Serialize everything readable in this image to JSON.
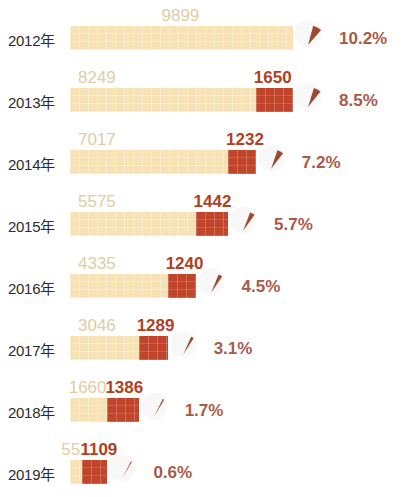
{
  "chart_data": {
    "type": "bar",
    "title": "",
    "subtitle": "",
    "xlabel": "",
    "ylabel": "",
    "orientation": "horizontal",
    "stacked": true,
    "grid": false,
    "legend_position": "none",
    "categories": [
      "2012年",
      "2013年",
      "2014年",
      "2015年",
      "2016年",
      "2017年",
      "2018年",
      "2019年"
    ],
    "series": [
      {
        "name": "cream",
        "color": "#f7e2b6",
        "values": [
          9899,
          8249,
          7017,
          5575,
          4335,
          3046,
          1660,
          551
        ]
      },
      {
        "name": "red",
        "color": "#c0452b",
        "values": [
          null,
          1650,
          1232,
          1442,
          1240,
          1289,
          1386,
          1109
        ]
      }
    ],
    "annotations": {
      "name": "percent",
      "color": "#a85a4a",
      "values": [
        "10.2%",
        "8.5%",
        "7.2%",
        "5.7%",
        "4.5%",
        "3.1%",
        "1.7%",
        "0.6%"
      ],
      "numeric": [
        10.2,
        8.5,
        7.2,
        5.7,
        4.5,
        3.1,
        1.7,
        0.6
      ],
      "marker": "pie-wedge"
    },
    "xlim": [
      0,
      9899
    ]
  },
  "rows": [
    {
      "year": "2012年",
      "cream": "9899",
      "red": "",
      "percent": "10.2%"
    },
    {
      "year": "2013年",
      "cream": "8249",
      "red": "1650",
      "percent": "8.5%"
    },
    {
      "year": "2014年",
      "cream": "7017",
      "red": "1232",
      "percent": "7.2%"
    },
    {
      "year": "2015年",
      "cream": "5575",
      "red": "1442",
      "percent": "5.7%"
    },
    {
      "year": "2016年",
      "cream": "4335",
      "red": "1240",
      "percent": "4.5%"
    },
    {
      "year": "2017年",
      "cream": "3046",
      "red": "1289",
      "percent": "3.1%"
    },
    {
      "year": "2018年",
      "cream": "1660",
      "red": "1386",
      "percent": "1.7%"
    },
    {
      "year": "2019年",
      "cream": "551",
      "red": "1109",
      "percent": "0.6%"
    }
  ],
  "colors": {
    "cream_bar": "#f7e2b6",
    "red_bar": "#c0452b",
    "cream_label": "#e0cda4",
    "red_label": "#b0411f",
    "percent_text": "#a85a4a",
    "year_text": "#2b2b2b",
    "wedge": "#9c4a2e",
    "background": "#ffffff"
  }
}
